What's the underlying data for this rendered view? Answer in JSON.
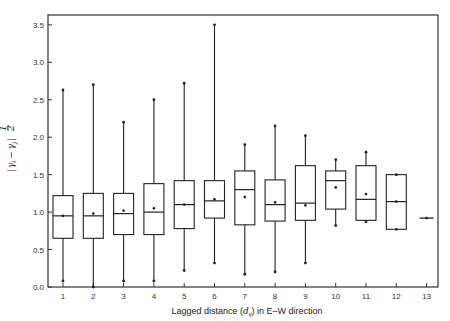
{
  "chart_data": {
    "type": "box",
    "title": "",
    "xlabel": "Lagged distance (d_ij) in E–W direction",
    "xlabel_parts": {
      "prefix": "Lagged distance (",
      "var": "d",
      "sub": "ij",
      "suffix": ") in E–W direction"
    },
    "ylabel": "|γi − γj|^(1/2)",
    "ylabel_parts": {
      "bar_left": "|",
      "gi": "γ",
      "i": "i",
      "minus": "−",
      "gj": "γ",
      "j": "j",
      "bar_right": "|",
      "exp_num": "1",
      "exp_den": "2"
    },
    "ylim": [
      0.0,
      3.6
    ],
    "yticks": [
      "0.0",
      "0.5",
      "1.0",
      "1.5",
      "2.0",
      "2.5",
      "3.0",
      "3.5"
    ],
    "ytick_values": [
      0.0,
      0.5,
      1.0,
      1.5,
      2.0,
      2.5,
      3.0,
      3.5
    ],
    "categories": [
      "1",
      "2",
      "3",
      "4",
      "5",
      "6",
      "7",
      "8",
      "9",
      "10",
      "11",
      "12",
      "13"
    ],
    "grid": false,
    "legend": null,
    "boxes": [
      {
        "lag": "1",
        "min": 0.08,
        "q1": 0.65,
        "median": 0.95,
        "mean": 0.95,
        "q3": 1.22,
        "max": 2.63
      },
      {
        "lag": "2",
        "min": 0.0,
        "q1": 0.65,
        "median": 0.95,
        "mean": 0.98,
        "q3": 1.25,
        "max": 2.7
      },
      {
        "lag": "3",
        "min": 0.08,
        "q1": 0.7,
        "median": 0.98,
        "mean": 1.02,
        "q3": 1.25,
        "max": 2.2
      },
      {
        "lag": "4",
        "min": 0.08,
        "q1": 0.7,
        "median": 1.0,
        "mean": 1.05,
        "q3": 1.38,
        "max": 2.5
      },
      {
        "lag": "5",
        "min": 0.22,
        "q1": 0.78,
        "median": 1.1,
        "mean": 1.1,
        "q3": 1.42,
        "max": 2.72
      },
      {
        "lag": "6",
        "min": 0.32,
        "q1": 0.92,
        "median": 1.15,
        "mean": 1.17,
        "q3": 1.42,
        "max": 3.5
      },
      {
        "lag": "7",
        "min": 0.17,
        "q1": 0.83,
        "median": 1.3,
        "mean": 1.2,
        "q3": 1.55,
        "max": 1.9
      },
      {
        "lag": "8",
        "min": 0.2,
        "q1": 0.88,
        "median": 1.1,
        "mean": 1.13,
        "q3": 1.43,
        "max": 2.15
      },
      {
        "lag": "9",
        "min": 0.32,
        "q1": 0.89,
        "median": 1.12,
        "mean": 1.09,
        "q3": 1.62,
        "max": 2.02
      },
      {
        "lag": "10",
        "min": 0.82,
        "q1": 1.04,
        "median": 1.42,
        "mean": 1.33,
        "q3": 1.55,
        "max": 1.7
      },
      {
        "lag": "11",
        "min": 0.87,
        "q1": 0.89,
        "median": 1.17,
        "mean": 1.24,
        "q3": 1.62,
        "max": 1.8
      },
      {
        "lag": "12",
        "min": 0.77,
        "q1": 0.77,
        "median": 1.14,
        "mean": 1.14,
        "q3": 1.5,
        "max": 1.5
      },
      {
        "lag": "13",
        "min": 0.92,
        "q1": 0.92,
        "median": 0.92,
        "mean": 0.92,
        "q3": 0.92,
        "max": 0.92
      }
    ]
  },
  "style": {
    "line_color": "#222222",
    "frame_color": "#333333",
    "background": "#ffffff"
  }
}
